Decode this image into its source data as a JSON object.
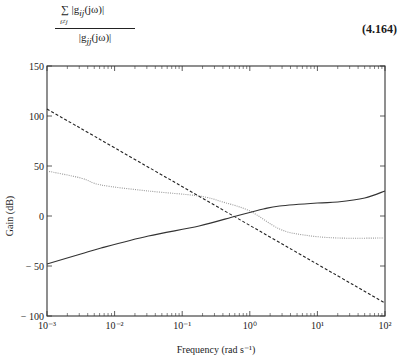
{
  "equation": {
    "sum_symbol": "∑",
    "sum_index": "i≠j",
    "numerator": "|g",
    "numerator_sub": "ij",
    "numerator_arg": "(jω)|",
    "denominator": "|g",
    "denominator_sub": "jj",
    "denominator_arg": "(jω)|",
    "number": "(4.164)"
  },
  "chart_data": {
    "type": "line",
    "title": "",
    "xlabel": "Frequency (rad s⁻¹)",
    "ylabel": "Gain (dB)",
    "xscale": "log",
    "xlim": [
      0.001,
      100
    ],
    "ylim": [
      -100,
      150
    ],
    "grid": false,
    "legend": null,
    "x_tick_labels": [
      "10⁻³",
      "10⁻²",
      "10⁻¹",
      "10⁰",
      "10¹",
      "10²"
    ],
    "y_tick_labels": [
      "150",
      "100",
      "50",
      "0",
      "− 50",
      "− 100"
    ],
    "y_ticks": [
      150,
      100,
      50,
      0,
      -50,
      -100
    ],
    "x": [
      0.001,
      0.006,
      0.03,
      0.18,
      0.63,
      2.75,
      20,
      100
    ],
    "series": [
      {
        "name": "dashed",
        "style": "dashed",
        "color": "#222222",
        "values": [
          107,
          92,
          78,
          63,
          53,
          40,
          24,
          -87
        ]
      },
      {
        "name": "dotted",
        "style": "dotted",
        "color": "#9a9a9a",
        "values": [
          45,
          31,
          25,
          20,
          5,
          -13,
          -22,
          -22
        ]
      },
      {
        "name": "solid",
        "style": "solid",
        "color": "#333333",
        "values": [
          -48,
          -32,
          -20,
          -10,
          0,
          10,
          14,
          25
        ]
      }
    ],
    "series_points": {
      "dashed": [
        [
          -3,
          107
        ],
        [
          2,
          -87
        ]
      ],
      "dotted": [
        [
          -3,
          45
        ],
        [
          -2.5,
          38
        ],
        [
          -2.2,
          31
        ],
        [
          -1.5,
          25
        ],
        [
          -0.75,
          20
        ],
        [
          -0.4,
          14
        ],
        [
          0,
          5
        ],
        [
          0.44,
          -13
        ],
        [
          0.8,
          -19
        ],
        [
          1.3,
          -22
        ],
        [
          2,
          -22
        ]
      ],
      "solid": [
        [
          -3,
          -48
        ],
        [
          -2.5,
          -38
        ],
        [
          -2.2,
          -32
        ],
        [
          -1.5,
          -20
        ],
        [
          -0.75,
          -10
        ],
        [
          -0.2,
          0
        ],
        [
          0.2,
          7
        ],
        [
          0.44,
          10
        ],
        [
          1.0,
          13
        ],
        [
          1.3,
          14
        ],
        [
          1.7,
          18
        ],
        [
          2,
          25
        ]
      ]
    }
  }
}
